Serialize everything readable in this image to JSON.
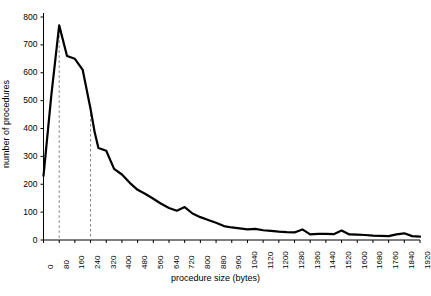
{
  "chart_data": {
    "type": "line",
    "title": "",
    "xlabel": "procedure size (bytes)",
    "ylabel": "number of procedures",
    "xlim": [
      0,
      1920
    ],
    "ylim": [
      0,
      800
    ],
    "grid": false,
    "legend": null,
    "x_ticks": [
      0,
      80,
      160,
      240,
      320,
      400,
      480,
      560,
      640,
      720,
      800,
      880,
      960,
      1040,
      1120,
      1200,
      1280,
      1360,
      1440,
      1520,
      1600,
      1680,
      1760,
      1840,
      1920
    ],
    "y_ticks": [
      0,
      100,
      200,
      300,
      400,
      500,
      600,
      700,
      800
    ],
    "x": [
      0,
      40,
      80,
      120,
      160,
      200,
      240,
      260,
      280,
      320,
      360,
      400,
      440,
      480,
      520,
      560,
      600,
      640,
      680,
      720,
      760,
      800,
      840,
      880,
      920,
      960,
      1000,
      1040,
      1080,
      1120,
      1160,
      1200,
      1240,
      1280,
      1320,
      1360,
      1400,
      1440,
      1480,
      1520,
      1560,
      1600,
      1640,
      1680,
      1720,
      1760,
      1800,
      1840,
      1880,
      1920
    ],
    "values": [
      230,
      520,
      770,
      660,
      650,
      610,
      470,
      390,
      330,
      320,
      255,
      235,
      205,
      180,
      165,
      148,
      130,
      115,
      105,
      118,
      95,
      82,
      72,
      62,
      50,
      45,
      42,
      38,
      40,
      35,
      33,
      30,
      28,
      27,
      38,
      20,
      22,
      22,
      21,
      34,
      20,
      19,
      18,
      16,
      15,
      14,
      20,
      24,
      14,
      12
    ],
    "annotations": [
      {
        "type": "vertical-dashed-line",
        "x": 80,
        "y_top": 770
      },
      {
        "type": "vertical-dashed-line",
        "x": 240,
        "y_top": 470
      }
    ],
    "series_color": "#000000",
    "dashed_line_color": "#808080"
  },
  "axis": {
    "y_label_text": "number of procedures",
    "x_label_text": "procedure size (bytes)"
  }
}
